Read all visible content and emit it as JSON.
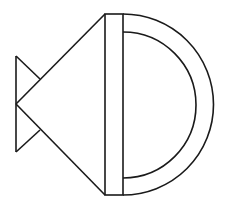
{
  "diagram": {
    "stroke_color": "#1a1a1a",
    "background": "#ffffff",
    "stroke_width": 1.6,
    "shapes": {
      "tail": {
        "points": "16,56 16,152 40,128"
      },
      "body": {
        "points": "105,14 16,104 105,195"
      },
      "bar": {
        "x": 105,
        "y": 14,
        "width": 18,
        "height": 181
      },
      "outer_arc": {
        "cx": 123,
        "cy": 104.5,
        "r": 90
      },
      "inner_arc": {
        "cx": 123,
        "cy": 105,
        "r": 73
      }
    }
  }
}
